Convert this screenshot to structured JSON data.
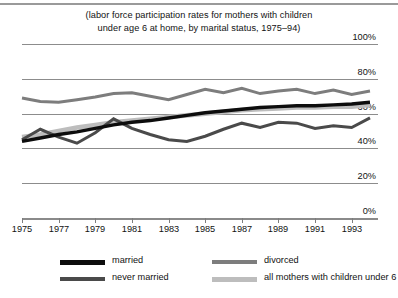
{
  "figure": {
    "title_line1": "(labor force participation rates for mothers with children",
    "title_line2": "under age 6 at home, by marital status, 1975–94)"
  },
  "axes": {
    "y_ticks": [
      "100%",
      "80%",
      "60%",
      "40%",
      "20%",
      "0%"
    ],
    "x_ticks": [
      "1975",
      "1977",
      "1979",
      "1981",
      "1983",
      "1985",
      "1987",
      "1989",
      "1991",
      "1993"
    ]
  },
  "legend": {
    "items": [
      {
        "label": "married",
        "color": "#0d0d0d"
      },
      {
        "label": "never married",
        "color": "#4a4a4a"
      },
      {
        "label": "divorced",
        "color": "#7d7d7d"
      },
      {
        "label": "all mothers with children under 6",
        "color": "#bdbdbd"
      }
    ]
  },
  "chart_data": {
    "type": "line",
    "title": "(labor force participation rates for mothers with children under age 6 at home, by marital status, 1975–94)",
    "xlabel": "",
    "ylabel": "",
    "xlim": [
      1975,
      1994
    ],
    "ylim": [
      0,
      100
    ],
    "ytick_values": [
      100,
      80,
      60,
      40,
      20,
      0
    ],
    "ytick_labels": [
      "100%",
      "80%",
      "60%",
      "40%",
      "20%",
      "0%"
    ],
    "xtick_values": [
      1975,
      1977,
      1979,
      1981,
      1983,
      1985,
      1987,
      1989,
      1991,
      1993
    ],
    "grid": "horizontal",
    "legend_position": "below",
    "x": [
      1975,
      1976,
      1977,
      1978,
      1979,
      1980,
      1981,
      1982,
      1983,
      1984,
      1985,
      1986,
      1987,
      1988,
      1989,
      1990,
      1991,
      1992,
      1993,
      1994
    ],
    "series": [
      {
        "name": "married",
        "color": "#0d0d0d",
        "width": 3.4,
        "values": [
          44.0,
          46.0,
          48.0,
          49.5,
          51.5,
          53.5,
          55.0,
          56.0,
          57.5,
          59.0,
          60.5,
          61.5,
          62.5,
          63.5,
          64.0,
          64.5,
          64.5,
          65.0,
          65.5,
          66.5
        ]
      },
      {
        "name": "never married",
        "color": "#4a4a4a",
        "width": 3.0,
        "values": [
          45.0,
          51.0,
          46.5,
          43.0,
          49.0,
          57.0,
          51.5,
          48.0,
          45.0,
          44.0,
          47.0,
          51.0,
          54.5,
          52.0,
          55.0,
          54.5,
          51.5,
          53.0,
          52.0,
          57.5
        ]
      },
      {
        "name": "divorced",
        "color": "#7d7d7d",
        "width": 3.0,
        "values": [
          69.0,
          67.0,
          66.5,
          68.0,
          69.5,
          71.5,
          72.0,
          70.0,
          68.0,
          71.0,
          74.0,
          72.0,
          74.5,
          71.5,
          73.0,
          74.0,
          71.5,
          73.5,
          71.0,
          73.0
        ]
      },
      {
        "name": "all mothers with children under 6",
        "color": "#bdbdbd",
        "width": 4.6,
        "values": [
          46.5,
          48.0,
          50.0,
          52.0,
          53.5,
          55.0,
          56.0,
          57.0,
          58.0,
          59.0,
          60.0,
          61.0,
          62.0,
          62.5,
          63.0,
          63.5,
          63.5,
          64.0,
          64.0,
          65.0
        ]
      }
    ]
  }
}
